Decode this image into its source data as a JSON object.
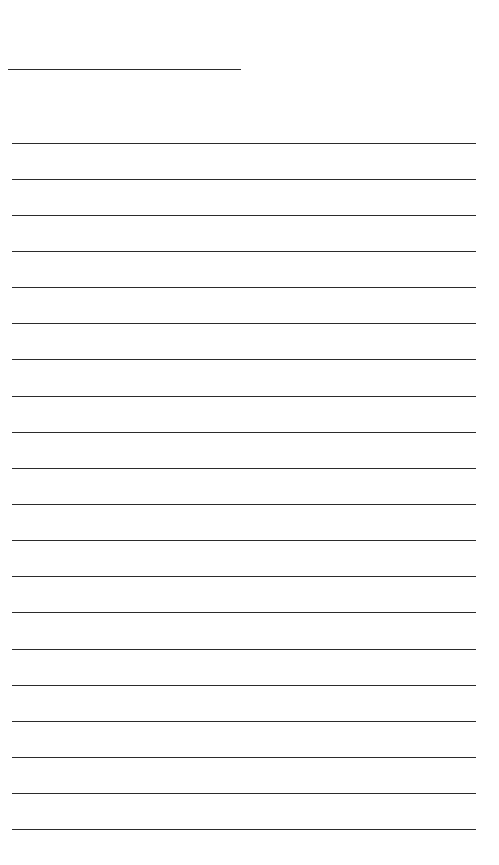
{
  "page": {
    "type": "lined-writing-sheet",
    "background": "#ffffff",
    "line_color": "#2b2b2b",
    "header_line": {
      "y": 69,
      "x_start": 8,
      "x_end": 241
    },
    "ruled_lines": {
      "count": 20,
      "x_start": 12,
      "x_end": 476,
      "y_positions": [
        143,
        179,
        215,
        251,
        287,
        323,
        359,
        396,
        432,
        468,
        504,
        540,
        576,
        612,
        649,
        685,
        721,
        757,
        793,
        829
      ]
    }
  }
}
